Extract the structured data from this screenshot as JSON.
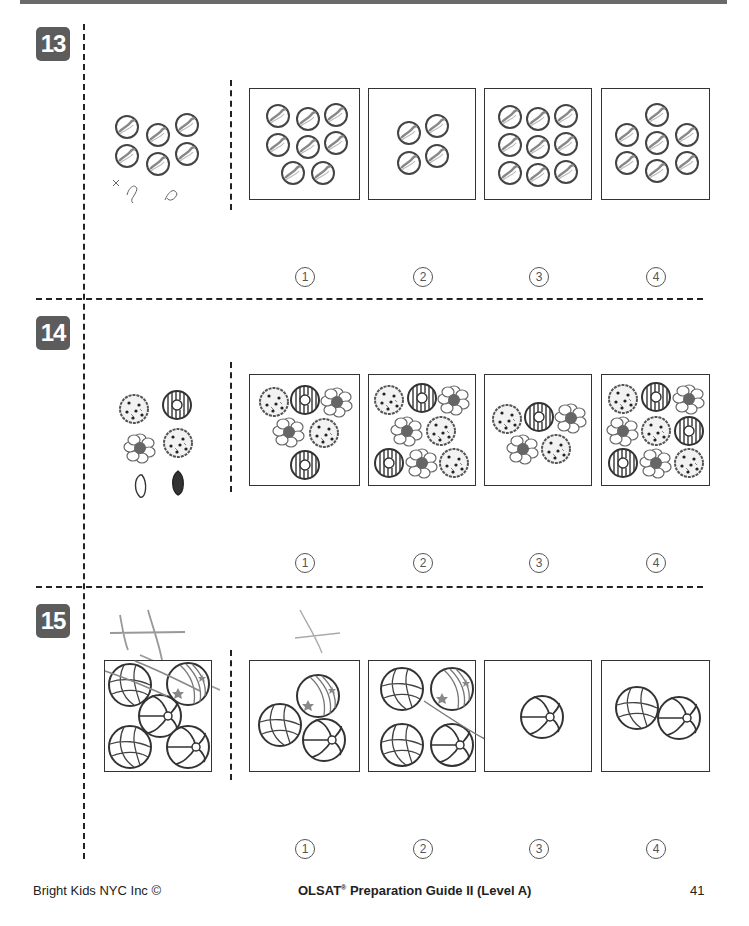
{
  "questions": [
    {
      "number": "13",
      "stimulus": "6 marbles",
      "options": [
        {
          "label": "1",
          "content": "8 marbles"
        },
        {
          "label": "2",
          "content": "4 marbles"
        },
        {
          "label": "3",
          "content": "9 marbles"
        },
        {
          "label": "4",
          "content": "7 marbles"
        }
      ]
    },
    {
      "number": "14",
      "stimulus": "cookie, donut, flower-pastry, cookie",
      "options": [
        {
          "label": "1",
          "content": "cookie, donut, flower, flower, cookie, donut"
        },
        {
          "label": "2",
          "content": "cookie, donut, flower, flower, cookie, donut, flower, cookie"
        },
        {
          "label": "3",
          "content": "cookie, donut, flower, flower, cookie"
        },
        {
          "label": "4",
          "content": "cookie, donut, flower, flower, cookie, donut, donut, flower, cookie"
        }
      ]
    },
    {
      "number": "15",
      "stimulus": "basketball, striped ball, beach ball, basketball, beach ball",
      "options": [
        {
          "label": "1",
          "content": "striped ball, basketball, beach ball"
        },
        {
          "label": "2",
          "content": "basketball, striped ball, basketball, beach ball"
        },
        {
          "label": "3",
          "content": "beach ball"
        },
        {
          "label": "4",
          "content": "basketball, beach ball"
        }
      ]
    }
  ],
  "option_glyphs": [
    "1",
    "2",
    "3",
    "4"
  ],
  "footer": {
    "left": "Bright Kids NYC Inc ©",
    "center": "OLSAT",
    "center_reg": "®",
    "center_rest": " Preparation Guide II (Level A)",
    "page_number": "41"
  }
}
